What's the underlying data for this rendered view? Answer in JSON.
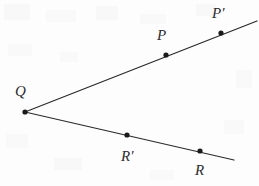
{
  "figure": {
    "type": "geometry-diagram",
    "width": 259,
    "height": 186,
    "background_color": "#fdfdfd",
    "stroke_color": "#2b2b2b",
    "point_color": "#1a1a1a",
    "label_color": "#2c2c2c"
  },
  "rays": [
    {
      "name": "upper-ray",
      "from": {
        "x": 25,
        "y": 112
      },
      "to": {
        "x": 257,
        "y": 21
      }
    },
    {
      "name": "lower-ray",
      "from": {
        "x": 25,
        "y": 112
      },
      "to": {
        "x": 234,
        "y": 160
      }
    }
  ],
  "points": [
    {
      "id": "Q",
      "label": "Q",
      "dot": {
        "x": 25,
        "y": 112
      },
      "label_pos": {
        "x": 15,
        "y": 84
      },
      "on_ray": "vertex"
    },
    {
      "id": "P",
      "label": "P",
      "dot": {
        "x": 166,
        "y": 55
      },
      "label_pos": {
        "x": 157,
        "y": 28
      },
      "on_ray": "upper-ray"
    },
    {
      "id": "Pprime",
      "label": "P′",
      "dot": {
        "x": 221,
        "y": 33
      },
      "label_pos": {
        "x": 212,
        "y": 6
      },
      "on_ray": "upper-ray"
    },
    {
      "id": "Rprime",
      "label": "R′",
      "dot": {
        "x": 127,
        "y": 135
      },
      "label_pos": {
        "x": 121,
        "y": 149
      },
      "on_ray": "lower-ray"
    },
    {
      "id": "R",
      "label": "R",
      "dot": {
        "x": 200,
        "y": 151
      },
      "label_pos": {
        "x": 195,
        "y": 163
      },
      "on_ray": "lower-ray"
    }
  ]
}
